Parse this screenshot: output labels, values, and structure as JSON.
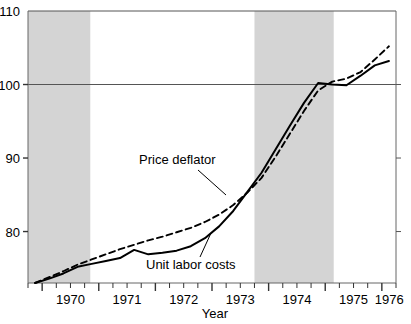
{
  "chart_data": {
    "type": "line",
    "title": "",
    "xlabel": "Year",
    "ylabel": "",
    "xlim": [
      1969.75,
      1976.25
    ],
    "ylim": [
      73,
      110
    ],
    "y_ticks": [
      80,
      90,
      100,
      110
    ],
    "y_tick_labels": [
      "80",
      "90",
      "100",
      "110"
    ],
    "x_ticks": [
      1970,
      1971,
      1972,
      1973,
      1974,
      1975,
      1976
    ],
    "x_tick_labels": [
      "1970",
      "1971",
      "1972",
      "1973",
      "1974",
      "1975",
      "1976"
    ],
    "x_minor_tick_interval_quarters": 1,
    "grid": false,
    "reference_lines": [
      {
        "axis": "y",
        "value": 100,
        "label": "100"
      },
      {
        "axis": "y",
        "value": 110,
        "label": "110"
      }
    ],
    "legend_position": "inline-annotations",
    "shaded_bands": [
      {
        "name": "recession-1969-1970",
        "x_start": 1969.75,
        "x_end": 1970.85,
        "color": "#d4d4d4"
      },
      {
        "name": "recession-1973-1975",
        "x_start": 1973.75,
        "x_end": 1975.15,
        "color": "#d4d4d4"
      }
    ],
    "x": [
      1969.875,
      1970.125,
      1970.375,
      1970.625,
      1970.875,
      1971.125,
      1971.375,
      1971.625,
      1971.875,
      1972.125,
      1972.375,
      1972.625,
      1972.875,
      1973.125,
      1973.375,
      1973.625,
      1973.875,
      1974.125,
      1974.375,
      1974.625,
      1974.875,
      1975.125,
      1975.375,
      1975.625,
      1975.875,
      1976.125
    ],
    "series": [
      {
        "name": "Price deflator",
        "style": "dashed",
        "color": "#000000",
        "values": [
          73.0,
          73.8,
          74.6,
          75.5,
          76.2,
          76.9,
          77.6,
          78.2,
          78.8,
          79.3,
          79.9,
          80.5,
          81.3,
          82.3,
          83.6,
          85.3,
          87.3,
          90.2,
          93.3,
          96.4,
          99.2,
          100.4,
          100.8,
          101.7,
          103.4,
          105.2
        ]
      },
      {
        "name": "Unit labor costs",
        "style": "solid",
        "color": "#000000",
        "values": [
          73.0,
          73.6,
          74.3,
          75.2,
          75.6,
          76.0,
          76.4,
          77.5,
          76.9,
          77.1,
          77.4,
          78.0,
          79.1,
          80.7,
          82.8,
          85.4,
          88.0,
          91.2,
          94.4,
          97.5,
          100.2,
          100.0,
          99.9,
          101.2,
          102.6,
          103.2
        ]
      }
    ],
    "annotations": [
      {
        "name": "price-deflator-annotation",
        "text": "Price deflator",
        "text_x": 139,
        "text_y": 164,
        "leader_from_x": 198,
        "leader_from_y": 170,
        "leader_to_x": 226,
        "leader_to_y": 195
      },
      {
        "name": "unit-labor-costs-annotation",
        "text": "Unit labor costs",
        "text_x": 146,
        "text_y": 269,
        "leader_from_x": 200,
        "leader_from_y": 257,
        "leader_to_x": 211,
        "leader_to_y": 233
      }
    ]
  },
  "axis": {
    "x_title": "Year"
  },
  "colors": {
    "band": "#d4d4d4",
    "line": "#000000",
    "frame": "#666666",
    "reference": "#555555"
  }
}
